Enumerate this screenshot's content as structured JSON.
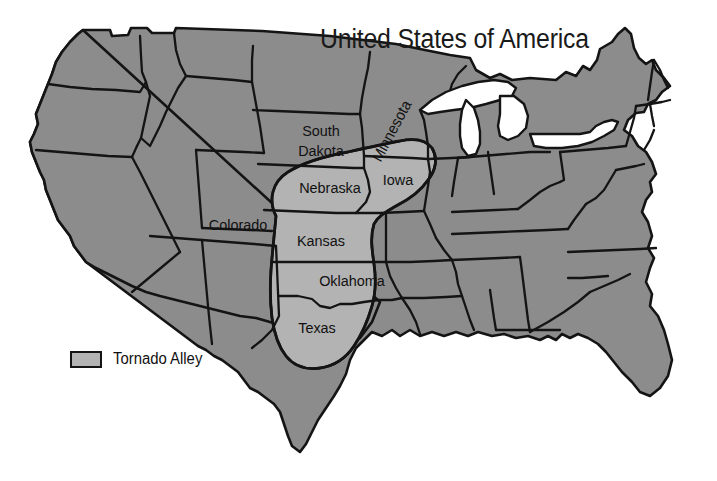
{
  "map": {
    "title": "United States of America",
    "country": "United States of America",
    "background_color": "#ffffff",
    "state_fill_color": "#8c8c8c",
    "highlight_fill_color": "#b3b3b3",
    "border_color": "#141414",
    "lake_fill_color": "#ffffff"
  },
  "legend": {
    "swatch_color": "#b3b3b3",
    "label": "Tornado Alley"
  },
  "labels": [
    {
      "id": "south-dakota",
      "name": "South Dakota",
      "line1": "South",
      "line2": "Dakota",
      "x": 321,
      "y": 141,
      "rotation": 0
    },
    {
      "id": "minnesota",
      "name": "Minnesota",
      "line1": "Minnesota",
      "line2": "",
      "x": 392,
      "y": 131,
      "rotation": -62
    },
    {
      "id": "iowa",
      "name": "Iowa",
      "line1": "Iowa",
      "line2": "",
      "x": 398,
      "y": 180,
      "rotation": 0
    },
    {
      "id": "nebraska",
      "name": "Nebraska",
      "line1": "Nebraska",
      "line2": "",
      "x": 330,
      "y": 188,
      "rotation": 0
    },
    {
      "id": "colorado",
      "name": "Colorado",
      "line1": "Colorado",
      "line2": "",
      "x": 238,
      "y": 225,
      "rotation": 0
    },
    {
      "id": "kansas",
      "name": "Kansas",
      "line1": "Kansas",
      "line2": "",
      "x": 321,
      "y": 241,
      "rotation": 0
    },
    {
      "id": "oklahoma",
      "name": "Oklahoma",
      "line1": "Oklahoma",
      "line2": "",
      "x": 352,
      "y": 281,
      "rotation": 0
    },
    {
      "id": "texas",
      "name": "Texas",
      "line1": "Texas",
      "line2": "",
      "x": 317,
      "y": 328,
      "rotation": 0
    }
  ],
  "tornado_alley": {
    "label": "Tornado Alley",
    "states_covered": [
      "Iowa",
      "Nebraska",
      "Kansas",
      "Oklahoma",
      "Texas",
      "South Dakota",
      "Minnesota"
    ]
  }
}
